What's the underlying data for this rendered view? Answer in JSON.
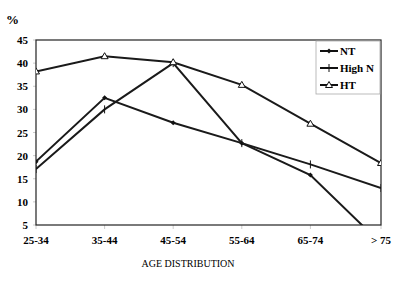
{
  "chart_data": {
    "type": "line",
    "title": "",
    "ylabel": "%",
    "xlabel": "AGE DISTRIBUTION",
    "categories": [
      "25-34",
      "35-44",
      "45-54",
      "55-64",
      "65-74",
      "> 75"
    ],
    "ylim": [
      5,
      45
    ],
    "yticks": [
      5,
      10,
      15,
      20,
      25,
      30,
      35,
      40,
      45
    ],
    "grid": false,
    "legend_position": "top-right",
    "series": [
      {
        "name": "NT",
        "marker": "diamond",
        "values": [
          18.7,
          32.5,
          27.1,
          22.7,
          15.8,
          1
        ]
      },
      {
        "name": "High N",
        "marker": "plus",
        "values": [
          17.1,
          30,
          40,
          22.7,
          18.1,
          13
        ]
      },
      {
        "name": "HT",
        "marker": "triangle",
        "values": [
          38.2,
          41.5,
          40.2,
          35.3,
          26.9,
          18.4
        ]
      }
    ]
  },
  "legend": {
    "items": [
      "NT",
      "High N",
      "HT"
    ]
  },
  "axis": {
    "unit": "%",
    "xtitle": "AGE DISTRIBUTION"
  }
}
